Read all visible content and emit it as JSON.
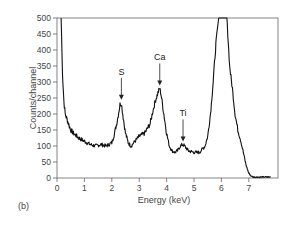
{
  "chart_data": {
    "type": "line",
    "title": "",
    "panel_label": "(b)",
    "xlabel": "Energy (keV)",
    "ylabel": "Counts/channel",
    "xlim": [
      0,
      7.9
    ],
    "ylim": [
      0,
      500
    ],
    "xticks": [
      0,
      1,
      2,
      3,
      4,
      5,
      6,
      7
    ],
    "yticks": [
      0,
      50,
      100,
      150,
      200,
      250,
      300,
      350,
      400,
      450,
      500
    ],
    "grid": false,
    "legend": null,
    "series": [
      {
        "name": "X-ray spectrum",
        "x": [
          0.15,
          0.2,
          0.25,
          0.3,
          0.4,
          0.5,
          0.6,
          0.8,
          1.0,
          1.2,
          1.4,
          1.6,
          1.8,
          2.0,
          2.1,
          2.2,
          2.3,
          2.35,
          2.4,
          2.5,
          2.6,
          2.7,
          2.8,
          3.0,
          3.2,
          3.4,
          3.5,
          3.6,
          3.7,
          3.75,
          3.8,
          3.9,
          4.0,
          4.1,
          4.2,
          4.3,
          4.4,
          4.5,
          4.6,
          4.7,
          4.8,
          5.0,
          5.2,
          5.4,
          5.5,
          5.6,
          5.7,
          5.8,
          5.9,
          6.0,
          6.2,
          6.3,
          6.4,
          6.5,
          6.6,
          6.7,
          6.8,
          6.9,
          7.0,
          7.1,
          7.2,
          7.4,
          7.6,
          7.8
        ],
        "y": [
          500,
          330,
          240,
          200,
          175,
          150,
          140,
          125,
          115,
          105,
          100,
          105,
          100,
          110,
          140,
          180,
          230,
          235,
          200,
          140,
          110,
          100,
          110,
          130,
          140,
          170,
          210,
          245,
          270,
          280,
          260,
          200,
          140,
          100,
          85,
          80,
          85,
          100,
          105,
          95,
          85,
          80,
          80,
          100,
          130,
          200,
          300,
          420,
          500,
          500,
          500,
          350,
          280,
          200,
          150,
          120,
          80,
          40,
          15,
          5,
          3,
          3,
          3,
          3
        ]
      }
    ],
    "annotations": [
      {
        "text": "S",
        "x": 2.35,
        "y": 235,
        "arrow": "down"
      },
      {
        "text": "Ca",
        "x": 3.75,
        "y": 280,
        "arrow": "down"
      },
      {
        "text": "Ti",
        "x": 4.6,
        "y": 105,
        "arrow": "down"
      }
    ]
  }
}
